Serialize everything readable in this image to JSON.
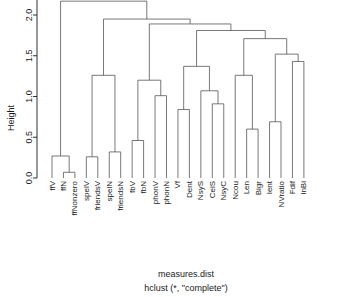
{
  "plot": {
    "kind": "cluster-dendrogram",
    "background": "#ffffff",
    "branch_color": "#555555",
    "axis_color": "#1a1a1a",
    "caption_line1": "measures.dist",
    "caption_line2": "hclust (*, \"complete\")",
    "ylabel": "Height"
  },
  "axis": {
    "ticks": [
      "0.0",
      "0.5",
      "1.0",
      "1.5",
      "2.0"
    ],
    "tick_values": [
      0.0,
      0.5,
      1.0,
      1.5,
      2.0
    ],
    "ymin": 0.0,
    "ymax": 2.2
  },
  "chart_data": {
    "type": "dendrogram",
    "title": "",
    "subtitle": "hclust (*, \"complete\")",
    "xlabel": "measures.dist",
    "ylabel": "Height",
    "ylim": [
      0.0,
      2.2
    ],
    "grid": false,
    "legend": "none",
    "linkage": "complete",
    "distance_object": "measures.dist",
    "n_leaves": 24,
    "leaf_order": [
      "ffV",
      "ffN",
      "ffNonzero",
      "spelV",
      "friendsV",
      "spelN",
      "friendsN",
      "fbV",
      "fbN",
      "phonV",
      "phonN",
      "Vf",
      "Dent",
      "NsyS",
      "CelS",
      "NsyC",
      "Ncou",
      "Len",
      "Bigr",
      "Ient",
      "NVratio",
      "Fdif",
      "InBi"
    ],
    "leaf_labels": [
      "ffV",
      "ffN",
      "ffNonzero",
      "spelV",
      "friendsV",
      "spelN",
      "friendsN",
      "fbV",
      "fbN",
      "phonV",
      "phonN",
      "Vf",
      "Dent",
      "NsyS",
      "CelS",
      "NsyC",
      "Ncou",
      "Len",
      "Bigr",
      "Ient",
      "NVratio",
      "Fdif",
      "InBi"
    ],
    "merges": [
      {
        "id": "m1",
        "left": "ffN",
        "right": "ffNonzero",
        "height": 0.07
      },
      {
        "id": "m2",
        "left": "ffV",
        "right": "m1",
        "height": 0.27
      },
      {
        "id": "m3",
        "left": "spelV",
        "right": "friendsV",
        "height": 0.26
      },
      {
        "id": "m4",
        "left": "spelN",
        "right": "friendsN",
        "height": 0.32
      },
      {
        "id": "m5",
        "left": "m3",
        "right": "m4",
        "height": 1.26
      },
      {
        "id": "m6",
        "left": "fbV",
        "right": "fbN",
        "height": 0.46
      },
      {
        "id": "m7",
        "left": "phonV",
        "right": "phonN",
        "height": 1.01
      },
      {
        "id": "m8",
        "left": "m6",
        "right": "m7",
        "height": 1.2
      },
      {
        "id": "m9",
        "left": "Vf",
        "right": "Dent",
        "height": 0.84
      },
      {
        "id": "m10",
        "left": "CelS",
        "right": "NsyC",
        "height": 0.91
      },
      {
        "id": "m11",
        "left": "NsyS",
        "right": "m10",
        "height": 1.07
      },
      {
        "id": "m12",
        "left": "m9",
        "right": "m11",
        "height": 1.37
      },
      {
        "id": "m13",
        "left": "Len",
        "right": "Bigr",
        "height": 0.6
      },
      {
        "id": "m14",
        "left": "Ient",
        "right": "NVratio",
        "height": 0.69
      },
      {
        "id": "m15",
        "left": "Ncou",
        "right": "m13",
        "height": 1.26
      },
      {
        "id": "m16",
        "left": "Fdif",
        "right": "InBi",
        "height": 1.43
      },
      {
        "id": "m17",
        "left": "m14",
        "right": "m16",
        "height": 1.52
      },
      {
        "id": "m18",
        "left": "m15",
        "right": "m17",
        "height": 1.71
      },
      {
        "id": "m19",
        "left": "m12",
        "right": "m18",
        "height": 1.81
      },
      {
        "id": "m20",
        "left": "m8",
        "right": "m19",
        "height": 1.89
      },
      {
        "id": "m21",
        "left": "m5",
        "right": "m20",
        "height": 1.95
      },
      {
        "id": "m22",
        "left": "m2",
        "right": "m21",
        "height": 2.17
      }
    ]
  }
}
